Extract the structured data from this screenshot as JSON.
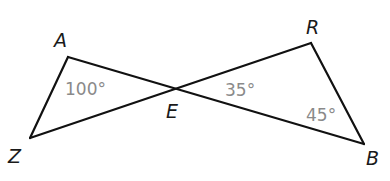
{
  "diagram": {
    "type": "two triangles sharing vertex E (vertical angles)",
    "points": {
      "A": {
        "label": "A",
        "x": 68,
        "y": 57
      },
      "Z": {
        "label": "Z",
        "x": 30,
        "y": 138
      },
      "E": {
        "label": "E",
        "x": 174,
        "y": 89
      },
      "R": {
        "label": "R",
        "x": 311,
        "y": 43
      },
      "B": {
        "label": "B",
        "x": 364,
        "y": 144
      }
    },
    "segments": [
      "AZ",
      "AB",
      "ZR",
      "RB"
    ],
    "triangles": [
      "AZE",
      "REB"
    ],
    "angles": [
      {
        "vertex": "A",
        "label": "100°"
      },
      {
        "vertex": "E",
        "triangle": "REB",
        "label": "35°"
      },
      {
        "vertex": "B",
        "label": "45°"
      }
    ]
  },
  "labels": {
    "A": "A",
    "Z": "Z",
    "E": "E",
    "R": "R",
    "B": "B",
    "angle_A": "100°",
    "angle_E": "35°",
    "angle_B": "45°"
  }
}
